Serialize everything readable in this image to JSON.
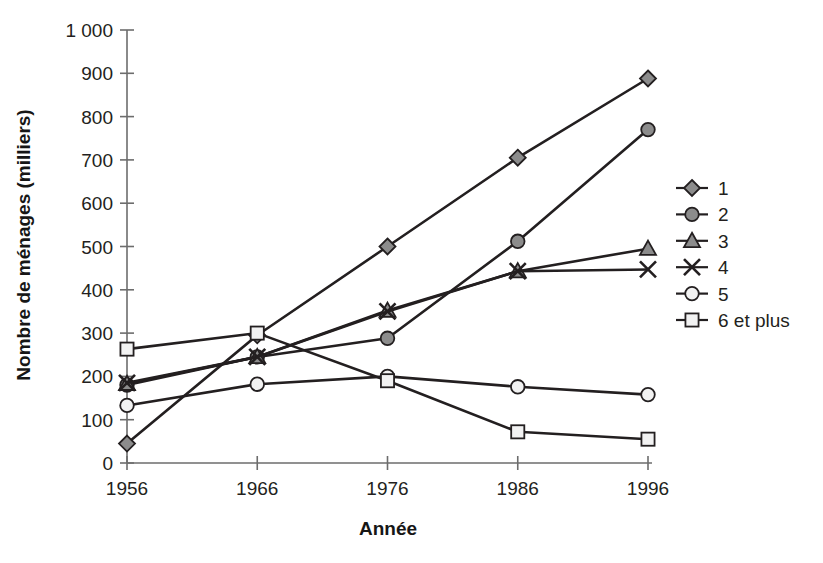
{
  "chart_data": {
    "type": "line",
    "title": "",
    "xlabel": "Année",
    "ylabel": "Nombre de ménages (milliers)",
    "x": [
      1956,
      1966,
      1976,
      1986,
      1996
    ],
    "xtick_labels": [
      "1956",
      "1966",
      "1976",
      "1986",
      "1996"
    ],
    "ytick_labels": [
      "0",
      "100",
      "200",
      "300",
      "400",
      "500",
      "600",
      "700",
      "800",
      "900",
      "1 000"
    ],
    "ytick_values": [
      0,
      100,
      200,
      300,
      400,
      500,
      600,
      700,
      800,
      900,
      1000
    ],
    "ylim": [
      0,
      1000
    ],
    "xlim": [
      1956,
      1996
    ],
    "grid": false,
    "legend_position": "right",
    "series": [
      {
        "name": "1",
        "marker": "diamond",
        "fill": "#8c8c8c",
        "values": [
          45,
          295,
          500,
          705,
          888
        ]
      },
      {
        "name": "2",
        "marker": "circle",
        "fill": "#8c8c8c",
        "values": [
          180,
          245,
          288,
          512,
          770
        ]
      },
      {
        "name": "3",
        "marker": "triangle",
        "fill": "#8c8c8c",
        "values": [
          183,
          245,
          352,
          443,
          495
        ]
      },
      {
        "name": "4",
        "marker": "x",
        "fill": "none",
        "values": [
          185,
          245,
          350,
          443,
          447
        ]
      },
      {
        "name": "5",
        "marker": "circle-open",
        "fill": "#f2f2f2",
        "values": [
          133,
          182,
          200,
          176,
          158
        ]
      },
      {
        "name": "6 et plus",
        "marker": "square-open",
        "fill": "#f2f2f2",
        "values": [
          263,
          300,
          190,
          72,
          55
        ]
      }
    ]
  },
  "legend": {
    "items": [
      {
        "label": "1"
      },
      {
        "label": "2"
      },
      {
        "label": "3"
      },
      {
        "label": "4"
      },
      {
        "label": "5"
      },
      {
        "label": "6 et plus"
      }
    ]
  },
  "colors": {
    "marker_gray": "#8c8c8c",
    "marker_light": "#f2f2f2",
    "stroke": "#231f20",
    "axis": "#6d6d6d",
    "background": "#ffffff"
  }
}
